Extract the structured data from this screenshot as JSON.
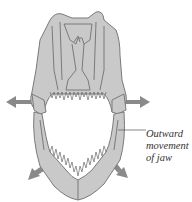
{
  "figure": {
    "label_lines": [
      "Outward",
      "movement",
      "of jaw"
    ],
    "colors": {
      "bone_fill": "#c9c9c9",
      "bone_stroke": "#7a7a7a",
      "arrow": "#8a8a8a",
      "leader_line": "#555555",
      "text": "#333333"
    },
    "arrows": [
      {
        "direction": "left",
        "position": "upper-left"
      },
      {
        "direction": "right",
        "position": "upper-right"
      },
      {
        "direction": "down-left",
        "position": "lower-left"
      },
      {
        "direction": "down-right",
        "position": "lower-right"
      }
    ]
  }
}
